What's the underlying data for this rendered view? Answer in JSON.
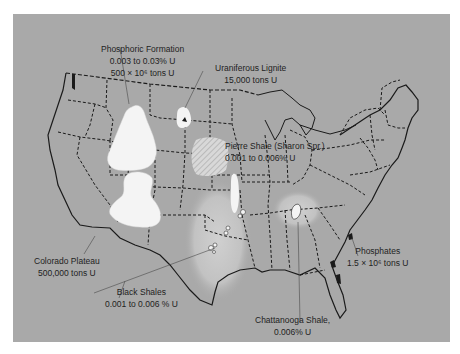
{
  "map": {
    "title": "Uranium deposits of the United States",
    "background_color": "#a9a9a9",
    "deposit_fill_color": "#f4f4f4",
    "shale_halo_color": "#c4c4c4",
    "border_color": "#1a1a1a"
  },
  "labels": {
    "phosphoric": {
      "name": "Phosphoric Formation",
      "line1": "0.003 to 0.03% U",
      "line2": "500 × 10⁶ tons U"
    },
    "lignite": {
      "name": "Uraniferous Lignite",
      "line1": "15,000 tons U"
    },
    "pierre": {
      "name": "Pierre Shale (Sharon Spr.)",
      "line1": "0.001 to 0.006% U"
    },
    "colorado": {
      "name": "Colorado Plateau",
      "line1": "500,000 tons U"
    },
    "black_shales": {
      "name": "Black Shales",
      "line1": "0.001 to 0.006 % U"
    },
    "chattanooga": {
      "name": "Chattanooga Shale,",
      "line1": "0.006% U"
    },
    "phosphates": {
      "name": "Phosphates",
      "line1": "1.5 × 10⁶ tons U"
    }
  }
}
